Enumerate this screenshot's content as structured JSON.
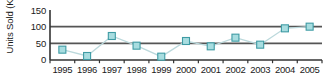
{
  "chart_data": {
    "type": "line",
    "title": "",
    "subtitle": "",
    "xlabel": "",
    "ylabel": "Units Sold (K)",
    "categories": [
      "1995",
      "1996",
      "1997",
      "1998",
      "1999",
      "2000",
      "2001",
      "2002",
      "2003",
      "2004",
      "2005"
    ],
    "values": [
      31,
      12,
      72,
      43,
      10,
      57,
      41,
      67,
      46,
      95,
      100
    ],
    "series": [
      {
        "name": "Units Sold",
        "values": [
          31,
          12,
          72,
          43,
          10,
          57,
          41,
          67,
          46,
          95,
          100
        ]
      }
    ],
    "ylim": [
      0,
      150
    ],
    "yticks": [
      0,
      50,
      100,
      150
    ],
    "ytick_labels": [
      "0",
      "50",
      "100",
      "150"
    ],
    "xtick_labels": [
      "1995",
      "1996",
      "1997",
      "1998",
      "1999",
      "2000",
      "2001",
      "2002",
      "2003",
      "2004",
      "2005"
    ],
    "grid": true,
    "gridlines_at": [
      50,
      100
    ],
    "legend": false,
    "legend_position": "none",
    "marker": "square",
    "colors": {
      "marker_fill": "#a8dde0",
      "marker_stroke": "#3f9ba4",
      "line": "#bcd9dc",
      "gridline": "#555555",
      "axis": "#333333",
      "text": "#1a1a1a",
      "background": "#ffffff"
    }
  }
}
